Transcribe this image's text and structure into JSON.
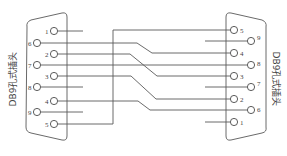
{
  "diagram": {
    "type": "wiring",
    "left_connector": {
      "label": "DB9孔式插头",
      "pins_top_to_bottom": [
        "1",
        "6",
        "2",
        "7",
        "3",
        "8",
        "4",
        "9",
        "5"
      ]
    },
    "right_connector": {
      "label": "DB9孔式插头",
      "pins_top_to_bottom": [
        "5",
        "9",
        "4",
        "8",
        "3",
        "7",
        "2",
        "6",
        "1"
      ]
    },
    "connections": [
      {
        "from": "L6",
        "to": "R4"
      },
      {
        "from": "L2",
        "to": "R3"
      },
      {
        "from": "L7",
        "to": "R8"
      },
      {
        "from": "L3",
        "to": "R2"
      },
      {
        "from": "L4",
        "to": "R6"
      },
      {
        "from": "L5",
        "to": "R5"
      }
    ],
    "unconnected_stubs": {
      "left": [
        "1",
        "8",
        "9"
      ],
      "right": [
        "9",
        "7",
        "1"
      ]
    },
    "colors": {
      "line": "#5a5a5a",
      "background": "#ffffff"
    }
  }
}
